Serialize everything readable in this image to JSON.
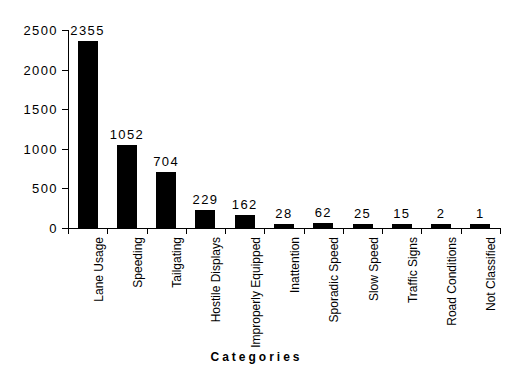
{
  "chart_data": {
    "type": "bar",
    "title": "",
    "subtitle": "",
    "xlabel": "Categories",
    "ylabel": "",
    "categories": [
      "Lane Usage",
      "Speeding",
      "Tailgating",
      "Hostile Displays",
      "Improperly Equipped",
      "Inattention",
      "Sporadic Speed",
      "Slow Speed",
      "Traffic Signs",
      "Road Conditions",
      "Not Classified"
    ],
    "values": [
      2355,
      1052,
      704,
      229,
      162,
      28,
      62,
      25,
      15,
      2,
      1
    ],
    "data_labels": [
      "2355",
      "1052",
      "704",
      "229",
      "162",
      "28",
      "62",
      "25",
      "15",
      "2",
      "1"
    ],
    "ylim": [
      0,
      2500
    ],
    "ytick_values": [
      0,
      500,
      1000,
      1500,
      2000,
      2500
    ],
    "ytick_labels": [
      "0",
      "500",
      "1000",
      "1500",
      "2000",
      "2500"
    ],
    "grid": false,
    "legend": null,
    "bar_color": "#000000",
    "background_color": "#ffffff",
    "axis_color": "#000000",
    "show_data_labels": true
  }
}
